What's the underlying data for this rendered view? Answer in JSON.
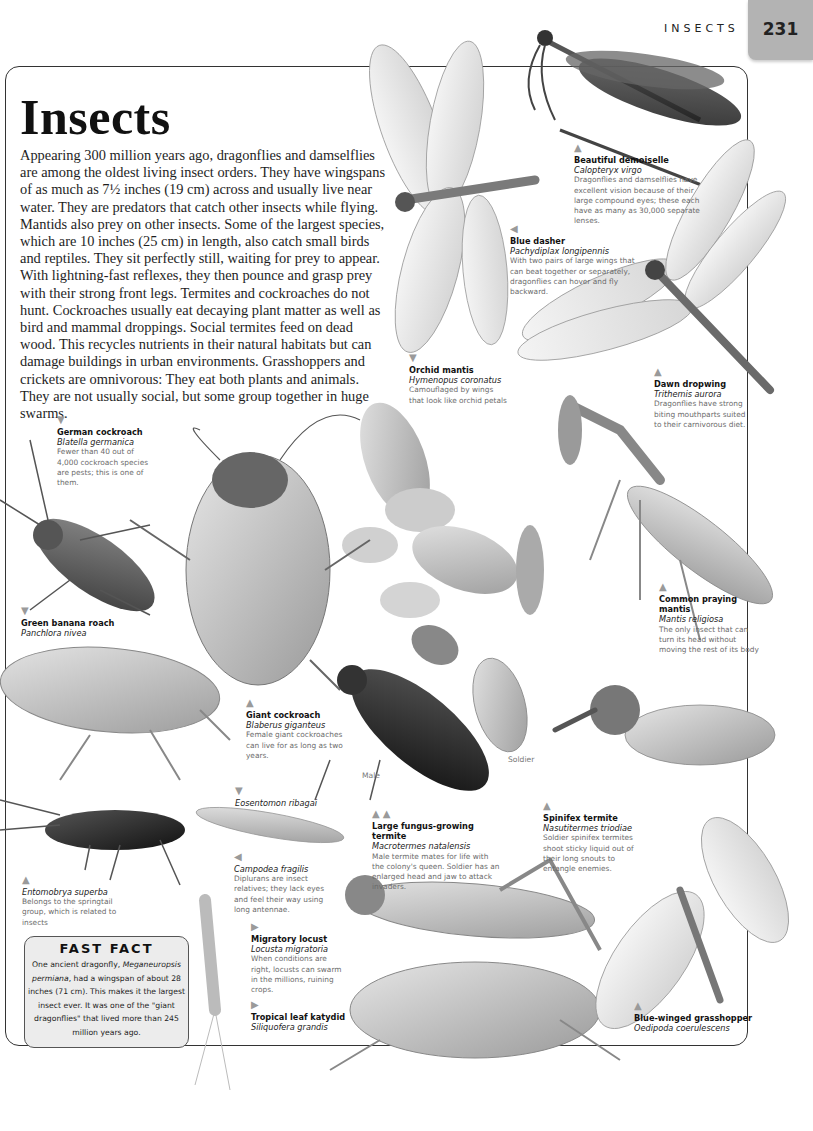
{
  "header": {
    "running_head": "INSECTS",
    "page_number": "231",
    "tab_color": "#b3b3b3"
  },
  "title": "Insects",
  "intro": "Appearing 300 million years ago, dragonflies and damselflies are among the oldest living insect orders. They have wingspans of as much as 7½ inches (19 cm) across and usually live near water. They are predators that catch other insects while flying. Mantids also prey on other insects. Some of the largest species, which are 10 inches (25 cm) in length, also catch small birds and reptiles. They sit perfectly still, waiting for prey to appear. With lightning-fast reflexes, they then pounce and grasp prey with their strong front legs. Termites and cockroaches do not hunt. Cockroaches usually eat decaying plant matter as well as bird and mammal droppings. Social termites feed on dead wood. This recycles nutrients in their natural habitats but can damage buildings in urban environments. Grasshoppers and crickets are omnivorous: They eat both plants and animals. They are not usually social, but some group together in huge swarms.",
  "labels": {
    "beautiful_demoiselle": {
      "arrow": "▲",
      "common": "Beautiful demoiselle",
      "latin": "Calopteryx virgo",
      "desc": "Dragonflies and damselflies have excellent vision because of their large compound eyes; these each have as many as 30,000 separate lenses."
    },
    "blue_dasher": {
      "arrow": "◀",
      "common": "Blue dasher",
      "latin": "Pachydiplax longipennis",
      "desc": "With two pairs of large wings that can beat together or separately, dragonflies can hover and fly backward."
    },
    "orchid_mantis": {
      "arrow": "▼",
      "common": "Orchid mantis",
      "latin": "Hymenopus coronatus",
      "desc": "Camouflaged by wings that look like orchid petals"
    },
    "dawn_dropwing": {
      "arrow": "▲",
      "common": "Dawn dropwing",
      "latin": "Trithemis aurora",
      "desc": "Dragonflies have strong biting mouthparts suited to their carnivorous diet."
    },
    "german_cockroach": {
      "arrow": "▼",
      "common": "German cockroach",
      "latin": "Blatella germanica",
      "desc": "Fewer than 40 out of 4,000 cockroach species are pests; this is one of them."
    },
    "green_banana_roach": {
      "arrow": "▼",
      "common": "Green banana roach",
      "latin": "Panchlora nivea"
    },
    "common_praying_mantis": {
      "arrow": "▲",
      "common": "Common praying mantis",
      "latin": "Mantis religiosa",
      "desc": "The only insect that can turn its head without moving the rest of its body"
    },
    "giant_cockroach": {
      "arrow": "▲",
      "common": "Giant cockroach",
      "latin": "Blaberus giganteus",
      "desc": "Female giant cockroaches can live for as long as two years."
    },
    "male": {
      "text": "Male"
    },
    "soldier": {
      "text": "Soldier"
    },
    "eosentomon": {
      "arrow": "▼",
      "latin": "Eosentomon ribagai"
    },
    "large_fungus_termite": {
      "arrow": "▲ ▲",
      "common": "Large fungus-growing termite",
      "latin": "Macrotermes natalensis",
      "desc": "Male termite mates for life with the colony's queen. Soldier has an enlarged head and jaw to attack invaders."
    },
    "spinifex_termite": {
      "arrow": "▲",
      "common": "Spinifex termite",
      "latin": "Nasutitermes triodiae",
      "desc": "Soldier spinifex termites shoot sticky liquid out of their long snouts to entangle enemies."
    },
    "entomobrya": {
      "arrow": "▲",
      "latin": "Entomobrya superba",
      "desc": "Belongs to the springtail group, which is related to insects"
    },
    "campodea": {
      "arrow": "◀",
      "latin": "Campodea fragilis",
      "desc": "Diplurans are insect relatives; they lack eyes and feel their way using long antennae."
    },
    "migratory_locust": {
      "arrow": "▶",
      "common": "Migratory locust",
      "latin": "Locusta migratoria",
      "desc": "When conditions are right, locusts can swarm in the millions, ruining crops."
    },
    "tropical_katydid": {
      "arrow": "▶",
      "common": "Tropical leaf katydid",
      "latin": "Siliquofera grandis"
    },
    "blue_winged_grasshopper": {
      "arrow": "▲",
      "common": "Blue-winged grasshopper",
      "latin": "Oedipoda coerulescens"
    }
  },
  "fast_fact": {
    "title": "FAST FACT",
    "text_before": "One ancient dragonfly, ",
    "species": "Meganeuropsis permiana",
    "text_after": ", had a wingspan of about 28 inches (71 cm). This makes it the largest insect ever. It was one of the \"giant dragonflies\" that lived more than 245 million years ago."
  },
  "illustrations": [
    "beautiful-demoiselle",
    "blue-dasher",
    "dawn-dropwing",
    "orchid-mantis",
    "german-cockroach",
    "giant-cockroach",
    "green-banana-roach",
    "common-praying-mantis",
    "termite-male",
    "termite-soldier",
    "spinifex-termite",
    "springtail",
    "eosentomon",
    "campodea",
    "migratory-locust",
    "tropical-leaf-katydid",
    "blue-winged-grasshopper"
  ]
}
